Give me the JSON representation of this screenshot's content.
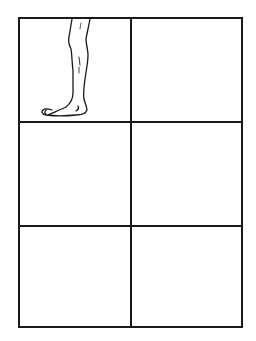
{
  "page": {
    "background": "#ffffff",
    "line_color": "#1a1a1a"
  },
  "grid": {
    "rows": 3,
    "columns": 2,
    "panels": [
      {
        "row": 1,
        "col": 1,
        "content": "leg-foot-drawing"
      },
      {
        "row": 1,
        "col": 2,
        "content": "empty"
      },
      {
        "row": 2,
        "col": 1,
        "content": "empty"
      },
      {
        "row": 2,
        "col": 2,
        "content": "empty"
      },
      {
        "row": 3,
        "col": 1,
        "content": "empty"
      },
      {
        "row": 3,
        "col": 2,
        "content": "empty"
      }
    ]
  },
  "illustration": {
    "subject": "lower leg and bare foot, side view, facing left",
    "style": "black line drawing"
  }
}
